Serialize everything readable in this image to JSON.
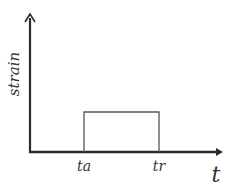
{
  "diagram": {
    "type": "step-pulse",
    "y_axis_label": "strain",
    "x_axis_label": "t",
    "tick_labels": [
      "ta",
      "tr"
    ],
    "colors": {
      "axis": "#2b2b2b",
      "pulse": "#555555",
      "text": "#333333",
      "background": "#ffffff"
    }
  }
}
